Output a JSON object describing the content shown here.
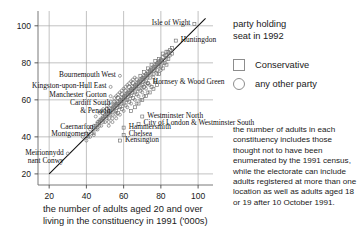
{
  "chart_data": {
    "type": "scatter",
    "title": "",
    "xlabel": "the number of adults aged 20 and over living in the constituency in 1991 ('000s)",
    "ylabel": "",
    "xlim": [
      14,
      108
    ],
    "ylim": [
      14,
      108
    ],
    "xticks": [
      20,
      40,
      60,
      80,
      100
    ],
    "yticks": [
      20,
      40,
      60,
      80,
      100
    ],
    "grid": true,
    "reference_line": {
      "type": "y=x",
      "from": [
        20,
        20
      ],
      "to": [
        104,
        104
      ]
    },
    "legend": {
      "position": "right",
      "title_line1": "party holding",
      "title_line2": "seat in 1992",
      "entries": [
        {
          "label": "Conservative",
          "marker": "square",
          "color": "#8d8d8d"
        },
        {
          "label": "any other party",
          "marker": "circle",
          "color": "#8d8d8d"
        }
      ]
    },
    "annotations": [
      {
        "text": "Isle of Wight",
        "x": 98,
        "y": 101,
        "align": "right",
        "marker": "square"
      },
      {
        "text": "Huntingdon",
        "x": 88,
        "y": 92,
        "align": "left",
        "marker": "square"
      },
      {
        "text": "Hornsey & Wood Green",
        "x": 73,
        "y": 69,
        "align": "left",
        "marker": "circle"
      },
      {
        "text": "Westminster North",
        "x": 70,
        "y": 51,
        "align": "left",
        "marker": "square"
      },
      {
        "text": "City of London & Westminster South",
        "x": 68,
        "y": 47,
        "align": "left",
        "marker": "square"
      },
      {
        "text": "Bournemouth West",
        "x": 58,
        "y": 73,
        "align": "right",
        "marker": "circle"
      },
      {
        "text": "Kingston-upon-Hull East",
        "x": 53,
        "y": 67,
        "align": "right",
        "marker": "circle"
      },
      {
        "text": "Manchester Gorton",
        "x": 53,
        "y": 62,
        "align": "right",
        "marker": "circle"
      },
      {
        "text": "Cardiff South & Penarth",
        "x": 55,
        "y": 58,
        "align": "right",
        "marker": "circle"
      },
      {
        "text": "Hammersmith",
        "x": 60,
        "y": 45,
        "align": "left",
        "marker": "square"
      },
      {
        "text": "Chelsea",
        "x": 60,
        "y": 41,
        "align": "left",
        "marker": "square"
      },
      {
        "text": "Kensington",
        "x": 58,
        "y": 38,
        "align": "left",
        "marker": "square"
      },
      {
        "text": "Caernarfon",
        "x": 46,
        "y": 45,
        "align": "right",
        "marker": "circle"
      },
      {
        "text": "Montgomery",
        "x": 44,
        "y": 41,
        "align": "right",
        "marker": "circle"
      },
      {
        "text": "Meirionnydd nant Conwy",
        "x": 30,
        "y": 31,
        "align": "right",
        "marker": "circle"
      }
    ],
    "series": [
      {
        "name": "Conservative",
        "marker": "square",
        "color": "#6f6f6f",
        "points": [
          [
            98,
            101
          ],
          [
            88,
            92
          ],
          [
            70,
            51
          ],
          [
            68,
            47
          ],
          [
            60,
            45
          ],
          [
            60,
            41
          ],
          [
            58,
            38
          ],
          [
            84,
            86
          ],
          [
            86,
            88
          ],
          [
            83,
            84
          ],
          [
            81,
            83
          ],
          [
            80,
            81
          ],
          [
            79,
            80
          ],
          [
            78,
            79
          ],
          [
            77,
            78
          ],
          [
            76,
            77
          ],
          [
            75,
            76
          ],
          [
            74,
            75
          ],
          [
            73,
            74
          ],
          [
            72,
            73
          ],
          [
            71,
            72
          ],
          [
            70,
            71
          ],
          [
            69,
            70
          ],
          [
            68,
            69
          ],
          [
            67,
            68
          ],
          [
            66,
            67
          ],
          [
            65,
            66
          ],
          [
            64,
            65
          ],
          [
            63,
            64
          ],
          [
            62,
            63
          ],
          [
            61,
            62
          ],
          [
            60,
            61
          ],
          [
            59,
            60
          ],
          [
            58,
            59
          ],
          [
            57,
            58
          ],
          [
            56,
            57
          ],
          [
            55,
            56
          ],
          [
            54,
            55
          ],
          [
            53,
            54
          ],
          [
            52,
            53
          ],
          [
            51,
            52
          ],
          [
            50,
            51
          ],
          [
            49,
            50
          ],
          [
            48,
            49
          ],
          [
            47,
            48
          ],
          [
            46,
            47
          ],
          [
            45,
            46
          ],
          [
            44,
            45
          ],
          [
            82,
            80
          ],
          [
            80,
            78
          ],
          [
            78,
            76
          ],
          [
            76,
            74
          ],
          [
            74,
            72
          ],
          [
            72,
            70
          ],
          [
            70,
            68
          ],
          [
            68,
            66
          ],
          [
            66,
            64
          ],
          [
            64,
            62
          ],
          [
            62,
            60
          ],
          [
            60,
            58
          ],
          [
            58,
            56
          ],
          [
            56,
            54
          ],
          [
            54,
            52
          ],
          [
            52,
            50
          ],
          [
            84,
            82
          ],
          [
            86,
            85
          ],
          [
            85,
            87
          ],
          [
            83,
            86
          ],
          [
            81,
            85
          ],
          [
            79,
            82
          ],
          [
            77,
            81
          ],
          [
            75,
            79
          ],
          [
            73,
            77
          ],
          [
            71,
            75
          ],
          [
            69,
            73
          ],
          [
            67,
            71
          ],
          [
            65,
            69
          ],
          [
            63,
            67
          ],
          [
            61,
            65
          ],
          [
            59,
            63
          ],
          [
            57,
            61
          ],
          [
            55,
            59
          ],
          [
            53,
            57
          ],
          [
            51,
            55
          ],
          [
            49,
            53
          ],
          [
            72,
            62
          ],
          [
            74,
            64
          ],
          [
            76,
            66
          ],
          [
            78,
            68
          ],
          [
            70,
            60
          ],
          [
            68,
            58
          ],
          [
            66,
            56
          ],
          [
            64,
            54
          ],
          [
            75,
            67
          ],
          [
            77,
            70
          ],
          [
            79,
            74
          ],
          [
            81,
            77
          ],
          [
            83,
            79
          ],
          [
            71,
            67
          ],
          [
            73,
            69
          ],
          [
            69,
            65
          ],
          [
            67,
            63
          ],
          [
            65,
            61
          ],
          [
            63,
            59
          ],
          [
            61,
            57
          ],
          [
            59,
            55
          ],
          [
            57,
            53
          ]
        ]
      },
      {
        "name": "any other party",
        "marker": "circle",
        "color": "#6f6f6f",
        "points": [
          [
            73,
            69
          ],
          [
            58,
            73
          ],
          [
            53,
            67
          ],
          [
            53,
            62
          ],
          [
            55,
            58
          ],
          [
            46,
            45
          ],
          [
            44,
            41
          ],
          [
            30,
            31
          ],
          [
            84,
            85
          ],
          [
            82,
            84
          ],
          [
            80,
            82
          ],
          [
            78,
            80
          ],
          [
            76,
            78
          ],
          [
            74,
            76
          ],
          [
            72,
            74
          ],
          [
            70,
            72
          ],
          [
            68,
            70
          ],
          [
            66,
            68
          ],
          [
            64,
            66
          ],
          [
            62,
            64
          ],
          [
            60,
            62
          ],
          [
            58,
            60
          ],
          [
            56,
            58
          ],
          [
            54,
            56
          ],
          [
            52,
            54
          ],
          [
            50,
            52
          ],
          [
            48,
            50
          ],
          [
            46,
            48
          ],
          [
            44,
            46
          ],
          [
            42,
            44
          ],
          [
            40,
            42
          ],
          [
            38,
            40
          ],
          [
            83,
            82
          ],
          [
            81,
            80
          ],
          [
            79,
            78
          ],
          [
            77,
            76
          ],
          [
            75,
            74
          ],
          [
            73,
            72
          ],
          [
            71,
            70
          ],
          [
            69,
            68
          ],
          [
            67,
            66
          ],
          [
            65,
            64
          ],
          [
            63,
            62
          ],
          [
            61,
            60
          ],
          [
            59,
            58
          ],
          [
            57,
            56
          ],
          [
            55,
            54
          ],
          [
            53,
            52
          ],
          [
            51,
            50
          ],
          [
            49,
            48
          ],
          [
            47,
            46
          ],
          [
            45,
            44
          ],
          [
            43,
            42
          ],
          [
            41,
            40
          ],
          [
            85,
            84
          ],
          [
            79,
            81
          ],
          [
            77,
            79
          ],
          [
            75,
            77
          ],
          [
            73,
            75
          ],
          [
            71,
            73
          ],
          [
            69,
            71
          ],
          [
            67,
            69
          ],
          [
            65,
            67
          ],
          [
            63,
            65
          ],
          [
            61,
            63
          ],
          [
            59,
            61
          ],
          [
            57,
            59
          ],
          [
            55,
            57
          ],
          [
            53,
            55
          ],
          [
            51,
            53
          ],
          [
            49,
            51
          ],
          [
            47,
            49
          ],
          [
            66,
            60
          ],
          [
            64,
            58
          ],
          [
            62,
            56
          ],
          [
            60,
            54
          ],
          [
            68,
            62
          ],
          [
            70,
            64
          ],
          [
            72,
            66
          ],
          [
            74,
            68
          ],
          [
            58,
            52
          ],
          [
            56,
            50
          ],
          [
            54,
            48
          ],
          [
            52,
            46
          ],
          [
            61,
            67
          ],
          [
            63,
            69
          ],
          [
            65,
            71
          ],
          [
            59,
            65
          ],
          [
            57,
            63
          ],
          [
            55,
            61
          ],
          [
            53,
            59
          ],
          [
            51,
            57
          ],
          [
            49,
            55
          ],
          [
            47,
            53
          ],
          [
            45,
            51
          ],
          [
            67,
            58
          ],
          [
            69,
            60
          ],
          [
            71,
            62
          ],
          [
            73,
            64
          ],
          [
            50,
            48
          ],
          [
            48,
            46
          ],
          [
            46,
            44
          ],
          [
            44,
            42
          ],
          [
            42,
            40
          ],
          [
            40,
            38
          ],
          [
            62,
            68
          ],
          [
            64,
            70
          ],
          [
            66,
            72
          ],
          [
            56,
            52
          ],
          [
            54,
            50
          ],
          [
            52,
            48
          ],
          [
            60,
            66
          ],
          [
            58,
            64
          ],
          [
            56,
            62
          ],
          [
            70,
            66
          ],
          [
            72,
            68
          ],
          [
            76,
            72
          ],
          [
            78,
            74
          ],
          [
            80,
            76
          ]
        ]
      }
    ]
  },
  "footnote": {
    "text": "the number of adults in each constituency includes those thought not to have been enumerated by the 1991 census, while the electorate can include adults registered at more than one location as well as adults aged 18 or 19 after 10 October 1991."
  }
}
